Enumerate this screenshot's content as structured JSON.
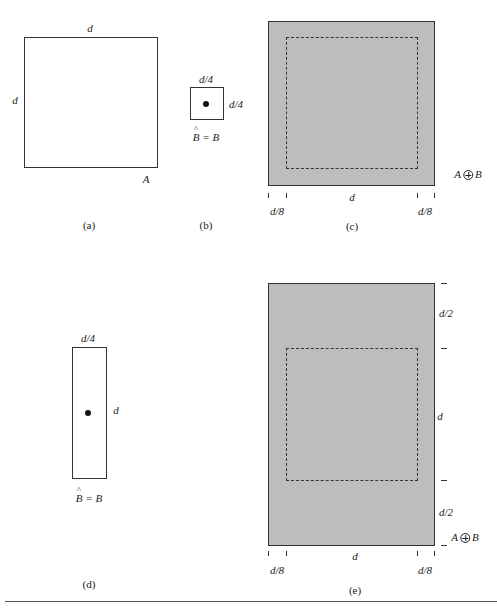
{
  "panels": {
    "a": {
      "caption": "(a)",
      "top_label": "d",
      "left_label": "d",
      "set_label": "A"
    },
    "b": {
      "caption": "(b)",
      "top_label": "d/4",
      "right_label": "d/4",
      "set_label_hat": "B",
      "set_label_rest": " = B"
    },
    "c": {
      "caption": "(c)",
      "set_label_left": "A",
      "set_label_right": "B",
      "bottom_center_label": "d",
      "bottom_left_label": "d/8",
      "bottom_right_label": "d/8"
    },
    "d": {
      "caption": "(d)",
      "top_label": "d/4",
      "right_label": "d",
      "set_label_hat": "B",
      "set_label_rest": " = B"
    },
    "e": {
      "caption": "(e)",
      "right_top_label": "d/2",
      "right_middle_label": "d",
      "right_bottom_label": "d/2",
      "set_label_left": "A",
      "set_label_right": "B",
      "bottom_center_label": "d",
      "bottom_left_label": "d/8",
      "bottom_right_label": "d/8"
    }
  },
  "colors": {
    "dilation_fill": "#bdbdbd",
    "outline": "#333333"
  }
}
